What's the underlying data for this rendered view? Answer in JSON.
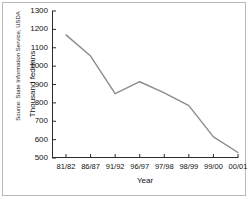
{
  "figure": {
    "source_note": "Source: State Information Service, USDA"
  },
  "chart_data": {
    "type": "line",
    "title": "",
    "xlabel": "Year",
    "ylabel": "Thousand feddans",
    "categories": [
      "81/82",
      "86/87",
      "91/92",
      "96/97",
      "97/98",
      "98/99",
      "99/00",
      "00/01"
    ],
    "values": [
      1170,
      1055,
      850,
      915,
      855,
      785,
      615,
      530
    ],
    "series": [
      {
        "name": "Thousand feddans",
        "values": [
          1170,
          1055,
          850,
          915,
          855,
          785,
          615,
          530
        ]
      }
    ],
    "ylim": [
      500,
      1300
    ],
    "yticks": [
      500,
      600,
      700,
      800,
      900,
      1000,
      1100,
      1200,
      1300
    ],
    "ytick_labels": [
      "500",
      "600",
      "700",
      "800",
      "900",
      "1000",
      "1100",
      "1200",
      "1300"
    ],
    "xtick_labels": [
      "81/82",
      "86/87",
      "91/92",
      "96/97",
      "97/98",
      "98/99",
      "99/00",
      "00/01"
    ],
    "grid": false,
    "legend": "none",
    "line_color": "#8c8c8c",
    "axis_color": "#2b2b2b",
    "background_color": "#ffffff"
  }
}
